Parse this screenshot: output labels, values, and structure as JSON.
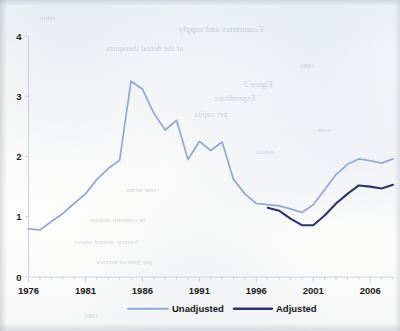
{
  "chart_data": {
    "type": "line",
    "title": "",
    "subtitle": "",
    "xlabel": "",
    "ylabel": "",
    "xlim": [
      1976,
      2008
    ],
    "ylim": [
      0,
      4
    ],
    "ytick_labels": [
      "0",
      "1",
      "2",
      "3",
      "4"
    ],
    "ytick_values": [
      0,
      1,
      2,
      3,
      4
    ],
    "xtick_labels": [
      "1976",
      "1981",
      "1986",
      "1991",
      "1996",
      "2001",
      "2006"
    ],
    "xtick_values": [
      1976,
      1981,
      1986,
      1991,
      1996,
      2001,
      2006
    ],
    "xtick_minor_interval": 1,
    "grid": false,
    "legend_position": "bottom",
    "x": [
      1976,
      1977,
      1978,
      1979,
      1980,
      1981,
      1982,
      1983,
      1984,
      1985,
      1986,
      1987,
      1988,
      1989,
      1990,
      1991,
      1992,
      1993,
      1994,
      1995,
      1996,
      1997,
      1998,
      1999,
      2000,
      2001,
      2002,
      2003,
      2004,
      2005,
      2006,
      2007,
      2008
    ],
    "series": [
      {
        "name": "Unadjusted",
        "color": "#8fa8d4",
        "values": [
          0.8,
          0.78,
          0.92,
          1.05,
          1.22,
          1.38,
          1.62,
          1.8,
          1.94,
          3.25,
          3.12,
          2.72,
          2.44,
          2.6,
          1.95,
          2.25,
          2.1,
          2.24,
          1.62,
          1.38,
          1.22,
          1.2,
          1.18,
          1.13,
          1.07,
          1.2,
          1.45,
          1.7,
          1.87,
          1.96,
          1.93,
          1.89,
          1.96
        ]
      },
      {
        "name": "Adjusted",
        "color": "#2c3666",
        "values": [
          null,
          null,
          null,
          null,
          null,
          null,
          null,
          null,
          null,
          null,
          null,
          null,
          null,
          null,
          null,
          null,
          null,
          null,
          null,
          null,
          null,
          1.15,
          1.1,
          0.97,
          0.86,
          0.86,
          1.02,
          1.22,
          1.38,
          1.52,
          1.5,
          1.47,
          1.53
        ]
      }
    ],
    "annotations": []
  },
  "legend": {
    "items": [
      {
        "label": "Unadjusted",
        "swatch": "light-blue-line"
      },
      {
        "label": "Adjusted",
        "swatch": "dark-navy-line"
      }
    ]
  },
  "colors": {
    "series_unadjusted": "#8fa8d4",
    "series_adjusted": "#2c3666",
    "axis": "#c9d2e2",
    "text": "#1b1b1b",
    "paper": "#fdfdfb"
  },
  "ghost_text": {
    "lines": [
      {
        "text": "Economics and supply",
        "x": 178,
        "y": 24,
        "size": 9
      },
      {
        "text": "of the dental therapists",
        "x": 106,
        "y": 44,
        "size": 8
      },
      {
        "text": "Figure 2",
        "x": 244,
        "y": 80,
        "size": 8
      },
      {
        "text": "Expenditure",
        "x": 214,
        "y": 94,
        "size": 8
      },
      {
        "text": "per capita",
        "x": 194,
        "y": 110,
        "size": 8
      },
      {
        "text": "real terms",
        "x": 126,
        "y": 186,
        "size": 7
      },
      {
        "text": "in constant dollars",
        "x": 90,
        "y": 216,
        "size": 7
      },
      {
        "text": "Source: annual report",
        "x": 74,
        "y": 238,
        "size": 7
      },
      {
        "text": "per year of service",
        "x": 96,
        "y": 258,
        "size": 7
      },
      {
        "text": "1986",
        "x": 300,
        "y": 62,
        "size": 7
      },
      {
        "text": "note",
        "x": 318,
        "y": 126,
        "size": 7
      },
      {
        "text": "dental",
        "x": 256,
        "y": 148,
        "size": 7
      },
      {
        "text": "table",
        "x": 40,
        "y": 14,
        "size": 7
      },
      {
        "text": "1996",
        "x": 84,
        "y": 312,
        "size": 7
      }
    ]
  }
}
